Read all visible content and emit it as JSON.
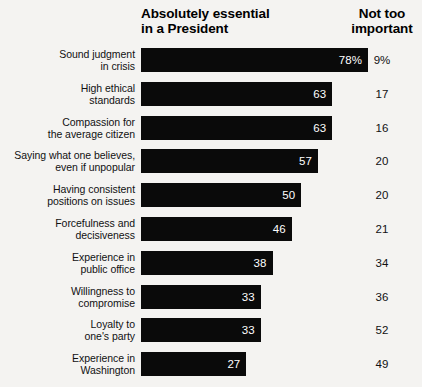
{
  "headers": {
    "essential": "Absolutely essential\nin a President",
    "not_too_important": "Not too\nimportant"
  },
  "chart_data": {
    "type": "bar",
    "orientation": "horizontal",
    "title": "Absolutely essential in a President",
    "xlabel": "",
    "ylabel": "",
    "xlim": [
      0,
      78
    ],
    "grid": false,
    "legend": "none",
    "categories": [
      "Sound judgment\nin crisis",
      "High ethical\nstandards",
      "Compassion for\nthe average citizen",
      "Saying what one believes,\neven if unpopular",
      "Having consistent\npositions on issues",
      "Forcefulness and\ndecisiveness",
      "Experience in\npublic office",
      "Willingness to\ncompromise",
      "Loyalty to\none's party",
      "Experience in\nWashington"
    ],
    "series": [
      {
        "name": "Absolutely essential in a President",
        "values": [
          78,
          63,
          63,
          57,
          50,
          46,
          38,
          33,
          33,
          27
        ],
        "labels": [
          "78%",
          "63",
          "63",
          "57",
          "50",
          "46",
          "38",
          "33",
          "33",
          "27"
        ]
      },
      {
        "name": "Not too important",
        "values": [
          9,
          17,
          16,
          20,
          20,
          21,
          34,
          36,
          52,
          49
        ],
        "labels": [
          "9%",
          "17",
          "16",
          "20",
          "20",
          "21",
          "34",
          "36",
          "52",
          "49"
        ]
      }
    ],
    "colors": {
      "bar": "#0a0a0a",
      "background": "#f4f3f1",
      "bar_label_text": "#ffffff",
      "text": "#111111"
    }
  }
}
